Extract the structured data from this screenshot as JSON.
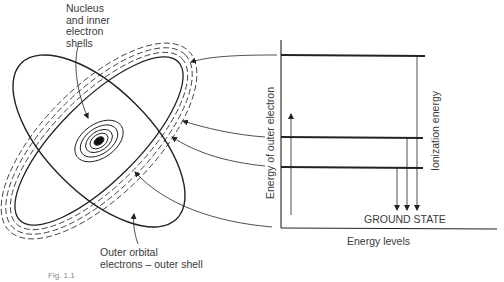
{
  "figure": {
    "atom": {
      "nucleus_label": [
        "Nucleus",
        "and inner",
        "electron",
        "shells"
      ],
      "outer_label": [
        "Outer orbital",
        "electrons – outer shell"
      ]
    },
    "energy_diagram": {
      "y_axis_label": "Energy of outer electron",
      "x_axis_label": "Energy levels",
      "ionization_label": "Ionization energy",
      "ground_state_label": "GROUND STATE",
      "levels": [
        {
          "name": "ionization",
          "y": 55
        },
        {
          "name": "level-2",
          "y": 137
        },
        {
          "name": "level-1",
          "y": 167
        }
      ]
    },
    "caption_partial": "Fig. 1.1"
  }
}
